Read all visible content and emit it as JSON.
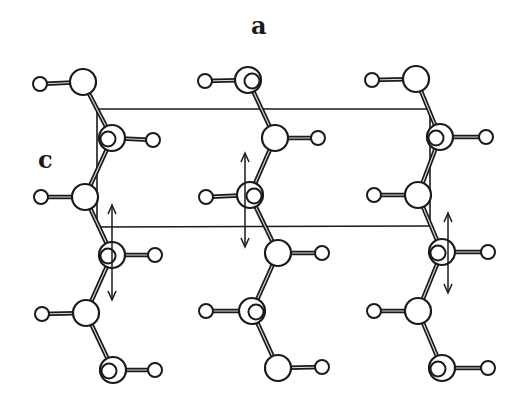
{
  "labels": {
    "a": "a",
    "c": "c"
  },
  "colors": {
    "stroke": "#1a1a1a",
    "fill": "#ffffff",
    "background": "#ffffff"
  },
  "unit_cell": {
    "top_line": {
      "x1": 97,
      "y1": 109,
      "x2": 430,
      "y2": 109
    },
    "bottom_line": {
      "x1": 97,
      "y1": 227,
      "x2": 430,
      "y2": 226
    },
    "left_edge": {
      "x1": 97,
      "y1": 109,
      "x2": 97,
      "y2": 227
    },
    "right_edge": {
      "x1": 430,
      "y1": 109,
      "x2": 430,
      "y2": 226
    }
  },
  "chains": [
    {
      "name": "left-chain",
      "oxygens": [
        {
          "x": 83,
          "y": 82,
          "inner": null,
          "h": {
            "x": 40,
            "y": 84
          }
        },
        {
          "x": 112,
          "y": 138,
          "inner": "left",
          "h": {
            "x": 153,
            "y": 140
          }
        },
        {
          "x": 85,
          "y": 197,
          "inner": null,
          "h": {
            "x": 41,
            "y": 197
          }
        },
        {
          "x": 112,
          "y": 255,
          "inner": "left",
          "h": {
            "x": 155,
            "y": 255
          }
        },
        {
          "x": 86,
          "y": 313,
          "inner": null,
          "h": {
            "x": 42,
            "y": 314
          }
        },
        {
          "x": 113,
          "y": 370,
          "inner": "left",
          "h": {
            "x": 155,
            "y": 370
          }
        }
      ],
      "arrow": {
        "x": 112,
        "y1": 205,
        "y2": 300
      }
    },
    {
      "name": "middle-chain",
      "oxygens": [
        {
          "x": 248,
          "y": 80,
          "inner": "right",
          "h": {
            "x": 205,
            "y": 81
          }
        },
        {
          "x": 275,
          "y": 138,
          "inner": null,
          "h": {
            "x": 318,
            "y": 138
          }
        },
        {
          "x": 250,
          "y": 195,
          "inner": "right",
          "h": {
            "x": 206,
            "y": 197
          }
        },
        {
          "x": 278,
          "y": 253,
          "inner": null,
          "h": {
            "x": 322,
            "y": 253
          }
        },
        {
          "x": 252,
          "y": 311,
          "inner": "right",
          "h": {
            "x": 206,
            "y": 311
          }
        },
        {
          "x": 278,
          "y": 368,
          "inner": null,
          "h": {
            "x": 322,
            "y": 367
          }
        }
      ],
      "arrow": {
        "x": 245,
        "y1": 153,
        "y2": 247
      }
    },
    {
      "name": "right-chain",
      "oxygens": [
        {
          "x": 416,
          "y": 79,
          "inner": null,
          "h": {
            "x": 372,
            "y": 80
          }
        },
        {
          "x": 440,
          "y": 137,
          "inner": "left",
          "h": {
            "x": 486,
            "y": 137
          }
        },
        {
          "x": 418,
          "y": 195,
          "inner": null,
          "h": {
            "x": 374,
            "y": 195
          }
        },
        {
          "x": 442,
          "y": 252,
          "inner": "left",
          "h": {
            "x": 488,
            "y": 252
          }
        },
        {
          "x": 418,
          "y": 311,
          "inner": null,
          "h": {
            "x": 374,
            "y": 311
          }
        },
        {
          "x": 442,
          "y": 368,
          "inner": "left",
          "h": {
            "x": 488,
            "y": 368
          }
        }
      ],
      "arrow": {
        "x": 448,
        "y1": 213,
        "y2": 293
      }
    }
  ],
  "sizes": {
    "oxygen_radius": 13,
    "inner_radius": 7.5,
    "hydrogen_radius": 7,
    "bond_width": 4.5
  }
}
